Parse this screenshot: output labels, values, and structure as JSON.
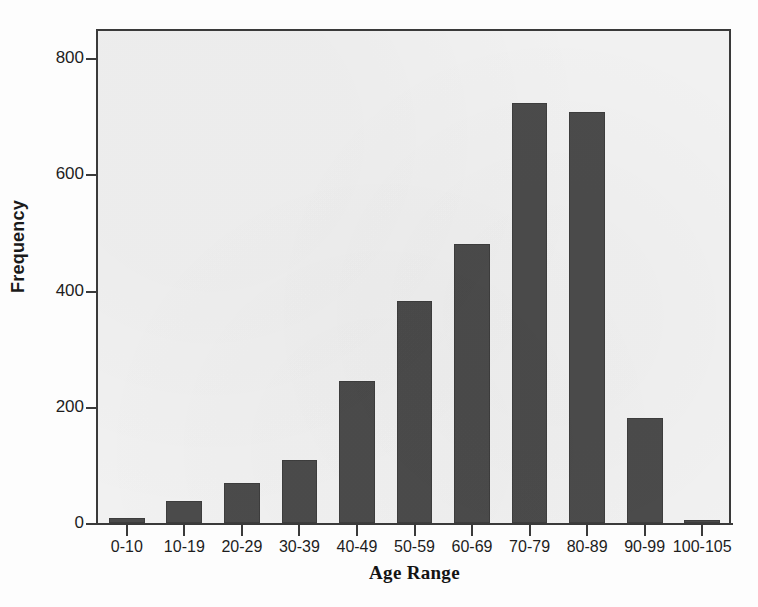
{
  "chart_data": {
    "type": "bar",
    "title": "",
    "subtitle": "",
    "xlabel": "Age Range",
    "ylabel": "Frequency",
    "categories": [
      "0-10",
      "10-19",
      "20-29",
      "30-39",
      "40-49",
      "50-59",
      "60-69",
      "70-79",
      "80-89",
      "90-99",
      "100-105"
    ],
    "values": [
      8,
      38,
      68,
      108,
      245,
      382,
      480,
      723,
      708,
      181,
      5
    ],
    "ylim": [
      0,
      850
    ],
    "y_ticks": [
      0,
      200,
      400,
      600,
      800
    ],
    "y_tick_labels": [
      "0",
      "200",
      "400",
      "600",
      "800"
    ],
    "grid": false,
    "legend": null,
    "legend_position": "none",
    "bar_color": "#4b4b4b",
    "plot_background": "#f1f1f1",
    "axis_color": "#3a3a3a",
    "annotations": []
  },
  "figure": {
    "background": "#fdfdfd",
    "axis_x_title": "Age Range",
    "axis_y_title": "Frequency"
  }
}
